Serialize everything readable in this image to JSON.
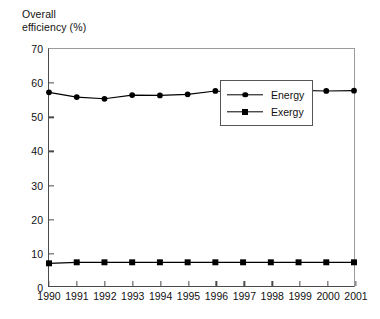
{
  "chart_data": {
    "type": "line",
    "title": "",
    "ylabel": "Overall\nefficiency (%)",
    "xlabel": "",
    "ylim": [
      0,
      70
    ],
    "yticks": [
      0,
      10,
      20,
      30,
      40,
      50,
      60,
      70
    ],
    "ytick_labels": [
      "0",
      "10",
      "20",
      "30",
      "40",
      "50",
      "60",
      "70"
    ],
    "grid": false,
    "legend_position": "center-right",
    "categories": [
      "1990",
      "1991",
      "1992",
      "1993",
      "1994",
      "1995",
      "1996",
      "1997",
      "1998",
      "1999",
      "2000",
      "2001"
    ],
    "x": [
      1990,
      1991,
      1992,
      1993,
      1994,
      1995,
      1996,
      1997,
      1998,
      1999,
      2000,
      2001
    ],
    "series": [
      {
        "name": "Energy",
        "marker": "circle",
        "color": "#000000",
        "values": [
          57.2,
          55.8,
          55.3,
          56.4,
          56.3,
          56.6,
          57.6,
          56.9,
          57.2,
          57.8,
          57.6,
          57.7
        ]
      },
      {
        "name": "Exergy",
        "marker": "square",
        "color": "#000000",
        "values": [
          6.7,
          7.0,
          7.0,
          7.0,
          7.0,
          7.0,
          7.0,
          7.0,
          7.0,
          7.0,
          7.0,
          7.0
        ]
      }
    ]
  },
  "legend": {
    "entries": [
      {
        "label": "Energy",
        "marker": "circle-marker-icon"
      },
      {
        "label": "Exergy",
        "marker": "square-marker-icon"
      }
    ]
  },
  "axis_label": {
    "y": "Overall\nefficiency (%)"
  }
}
